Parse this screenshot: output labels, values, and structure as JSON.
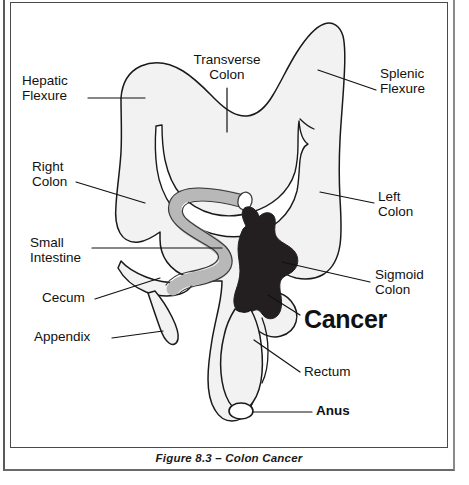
{
  "figure": {
    "caption": "Figure 8.3 – Colon Cancer",
    "title": "Colon Cancer"
  },
  "colors": {
    "outline": "#1a1a1a",
    "colon_fill": "#f2f2f2",
    "small_intestine_fill": "#b8b8b8",
    "cancer_fill": "#231f20",
    "background": "#ffffff",
    "frame": "#4a4a4a",
    "text": "#111111"
  },
  "labels": {
    "hepatic_flexure": {
      "line1": "Hepatic",
      "line2": "Flexure"
    },
    "transverse_colon": {
      "line1": "Transverse",
      "line2": "Colon"
    },
    "splenic_flexure": {
      "line1": "Splenic",
      "line2": "Flexure"
    },
    "right_colon": {
      "line1": "Right",
      "line2": "Colon"
    },
    "left_colon": {
      "line1": "Left",
      "line2": "Colon"
    },
    "small_intestine": {
      "line1": "Small",
      "line2": "Intestine"
    },
    "sigmoid_colon": {
      "line1": "Sigmoid",
      "line2": "Colon"
    },
    "cecum": {
      "line1": "Cecum"
    },
    "appendix": {
      "line1": "Appendix"
    },
    "cancer": {
      "line1": "Cancer"
    },
    "rectum": {
      "line1": "Rectum"
    },
    "anus": {
      "line1": "Anus"
    }
  },
  "anatomy_parts": [
    "Hepatic Flexure",
    "Transverse Colon",
    "Splenic Flexure",
    "Right Colon",
    "Left Colon",
    "Small Intestine",
    "Sigmoid Colon",
    "Cecum",
    "Appendix",
    "Cancer",
    "Rectum",
    "Anus"
  ]
}
